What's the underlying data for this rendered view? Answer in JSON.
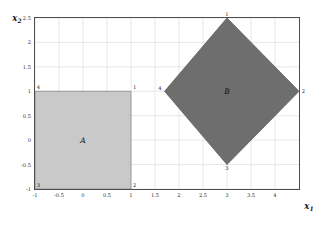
{
  "figure": {
    "background_color": "#ffffff",
    "plot_frame_color": "#4d4d4d",
    "grid_color": "#d8d8d8"
  },
  "axes": {
    "x": {
      "label": "x",
      "label_sub": "1",
      "ticks": [
        "-1",
        "-0.5",
        "0",
        "0.5",
        "1",
        "1.5",
        "2",
        "2.5",
        "3",
        "3.5",
        "4"
      ],
      "tick_values": [
        -1,
        -0.5,
        0,
        0.5,
        1,
        1.5,
        2,
        2.5,
        3,
        3.5,
        4
      ],
      "min": -1,
      "max": 4.5
    },
    "y": {
      "label": "x",
      "label_sub": "2",
      "ticks": [
        "-1",
        "-0.5",
        "0",
        "0.5",
        "1",
        "1.5",
        "2",
        "2.5"
      ],
      "tick_values": [
        -1,
        -0.5,
        0,
        0.5,
        1,
        1.5,
        2,
        2.5
      ],
      "min": -1,
      "max": 2.5
    }
  },
  "chart_data": {
    "type": "scatter",
    "title": "",
    "xlabel": "x1",
    "ylabel": "x2",
    "xlim": [
      -1,
      4.5
    ],
    "ylim": [
      -1,
      2.5
    ],
    "grid": true,
    "legend": "none",
    "regions": [
      {
        "name": "A",
        "letter": "A",
        "shape": "square",
        "fill_color": "#c9c9c9",
        "edge_color": "#8a8a8a",
        "letter_at": [
          0,
          0
        ],
        "vertices": [
          {
            "label": "1",
            "x": 1,
            "y": 1,
            "anchor": "top-right"
          },
          {
            "label": "2",
            "x": 1,
            "y": -1,
            "anchor": "bottom-right"
          },
          {
            "label": "3",
            "x": -1,
            "y": -1,
            "anchor": "bottom-left"
          },
          {
            "label": "4",
            "x": -1,
            "y": 1,
            "anchor": "top-left"
          }
        ]
      },
      {
        "name": "B",
        "letter": "B",
        "shape": "diamond",
        "fill_color": "#6e6e6e",
        "edge_color": "#5a5a5a",
        "letter_at": [
          3,
          1
        ],
        "vertices": [
          {
            "label": "1",
            "x": 3,
            "y": 2.5,
            "anchor": "top"
          },
          {
            "label": "2",
            "x": 4.5,
            "y": 1,
            "anchor": "right"
          },
          {
            "label": "3",
            "x": 3,
            "y": -0.5,
            "anchor": "bottom"
          },
          {
            "label": "4",
            "x": 1.7,
            "y": 1,
            "anchor": "left"
          }
        ]
      }
    ]
  }
}
